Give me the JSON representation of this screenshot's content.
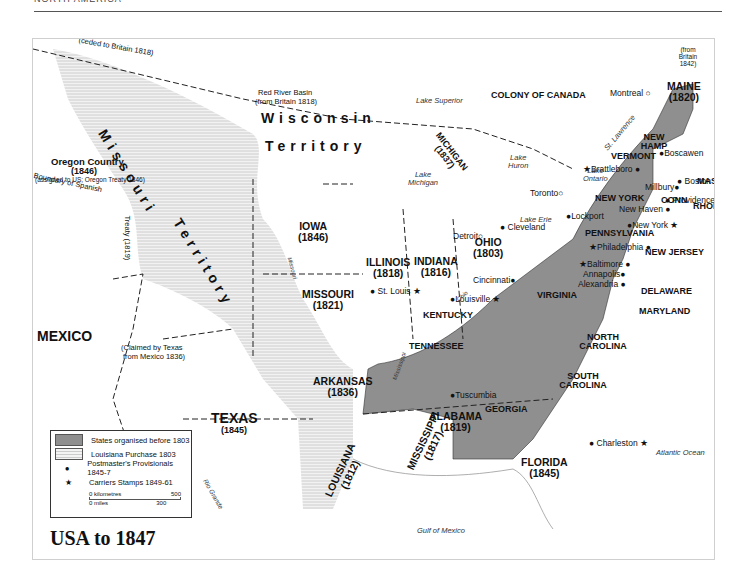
{
  "header": {
    "section_label": "NORTH AMERICA"
  },
  "map": {
    "title": "USA to 1847",
    "colors": {
      "states_pre_1803": "#8f8f8f",
      "louisiana_purchase": "#e4e4e4",
      "water": "#f7f7f7",
      "border": "#222222"
    },
    "regions": {
      "ceded": "(ceded to Britain 1818)",
      "red_river": "Red River Basin",
      "red_river_sub": "(from Britain 1818)",
      "canada": "COLONY OF CANADA",
      "oregon": "Oregon Country",
      "oregon_year": "(1846)",
      "oregon_sub": "(assigned to US; Oregon Treaty 1846)",
      "missouri_terr_1": "Missouri",
      "missouri_terr_2": "Territory",
      "wisconsin_1": "Wisconsin",
      "wisconsin_2": "Territory",
      "boundary_spanish": "Boundary of Spanish",
      "treaty": "Treaty (1819)",
      "claimed_texas": "(Claimed by Texas",
      "claimed_texas_2": "from Mexico 1836)",
      "mexico": "MEXICO",
      "texas": "TEXAS",
      "texas_year": "(1845)",
      "from_britain": "(from Britain 1842)"
    },
    "states": [
      {
        "name": "MAINE",
        "year": "(1820)"
      },
      {
        "name": "NEW HAMP",
        "year": ""
      },
      {
        "name": "VERMONT",
        "year": ""
      },
      {
        "name": "MASS",
        "year": ""
      },
      {
        "name": "CONN",
        "year": ""
      },
      {
        "name": "RHODE I.",
        "year": ""
      },
      {
        "name": "NEW YORK",
        "year": ""
      },
      {
        "name": "PENNSYLVANIA",
        "year": ""
      },
      {
        "name": "NEW JERSEY",
        "year": ""
      },
      {
        "name": "DELAWARE",
        "year": ""
      },
      {
        "name": "MARYLAND",
        "year": ""
      },
      {
        "name": "VIRGINIA",
        "year": ""
      },
      {
        "name": "NORTH CAROLINA",
        "year": ""
      },
      {
        "name": "SOUTH CAROLINA",
        "year": ""
      },
      {
        "name": "GEORGIA",
        "year": ""
      },
      {
        "name": "KENTUCKY",
        "year": ""
      },
      {
        "name": "TENNESSEE",
        "year": ""
      },
      {
        "name": "OHIO",
        "year": "(1803)"
      },
      {
        "name": "INDIANA",
        "year": "(1816)"
      },
      {
        "name": "ILLINOIS",
        "year": "(1818)"
      },
      {
        "name": "MICHIGAN",
        "year": "(1837)"
      },
      {
        "name": "IOWA",
        "year": "(1846)"
      },
      {
        "name": "MISSOURI",
        "year": "(1821)"
      },
      {
        "name": "ARKANSAS",
        "year": "(1836)"
      },
      {
        "name": "LOUISIANA",
        "year": "(1812)"
      },
      {
        "name": "MISSISSIPPI",
        "year": "(1817)"
      },
      {
        "name": "ALABAMA",
        "year": "(1819)"
      },
      {
        "name": "FLORIDA",
        "year": "(1845)"
      }
    ],
    "cities": {
      "montreal": "Montreal",
      "toronto": "Toronto",
      "detroit": "Detroit",
      "cleveland": "Cleveland",
      "lockport": "Lockport",
      "brattleboro": "Brattleboro",
      "boscawen": "Boscawen",
      "millbury": "Millbury",
      "boston": "Boston",
      "providence": "Providence",
      "new_haven": "New Haven",
      "new_york": "New York",
      "philadelphia": "Philadelphia",
      "baltimore": "Baltimore",
      "annapolis": "Annapolis",
      "alexandria": "Alexandria",
      "cincinnati": "Cincinnati",
      "louisville": "Louisville",
      "st_louis": "St. Louis",
      "tuscumbia": "Tuscumbia",
      "charleston": "Charleston"
    },
    "water": {
      "lake_superior": "Lake Superior",
      "lake_michigan_1": "Lake",
      "lake_michigan_2": "Michigan",
      "lake_huron_1": "Lake",
      "lake_huron_2": "Huron",
      "lake_ontario_1": "Lake",
      "lake_ontario_2": "Ontario",
      "lake_erie": "Lake Erie",
      "st_lawrence": "St. Lawrence",
      "missouri_river": "Missouri",
      "mississippi_river": "Mississippi",
      "ohio_river": "Ohio",
      "rio_grande": "Rio Grande",
      "atlantic": "Atlantic Ocean",
      "gulf": "Gulf of Mexico"
    },
    "legend": {
      "items": [
        {
          "label": "States organised before 1803",
          "symbol": "grey-swatch"
        },
        {
          "label": "Louisiana Purchase 1803",
          "symbol": "hatched-swatch"
        },
        {
          "label": "Postmaster's Provisionals 1845-7",
          "symbol": "●"
        },
        {
          "label": "Carriers Stamps 1849-61",
          "symbol": "★"
        }
      ],
      "scale_km_start": "0 kilometres",
      "scale_km_end": "500",
      "scale_mi_start": "0 miles",
      "scale_mi_end": "300"
    }
  }
}
